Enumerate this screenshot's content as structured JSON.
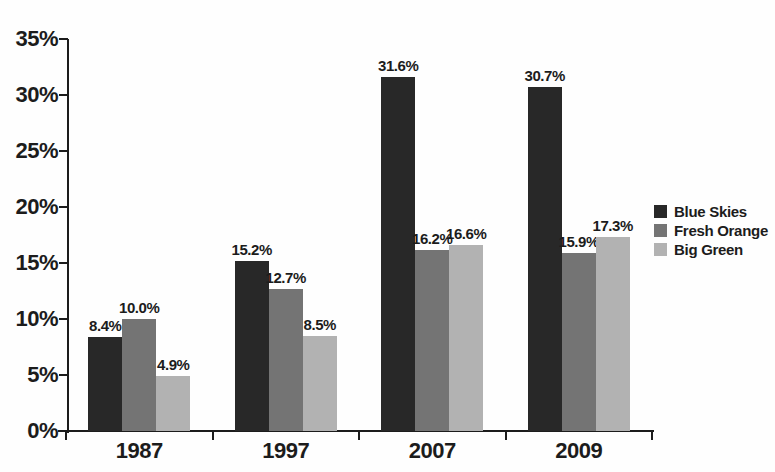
{
  "chart_data": {
    "type": "bar",
    "title": "",
    "categories": [
      "1987",
      "1997",
      "2007",
      "2009"
    ],
    "series": [
      {
        "name": "Blue Skies",
        "color": "#282828",
        "values": [
          8.4,
          15.2,
          31.6,
          30.7
        ],
        "labels": [
          "8.4%",
          "15.2%",
          "31.6%",
          "30.7%"
        ]
      },
      {
        "name": "Fresh Orange",
        "color": "#747474",
        "values": [
          10.0,
          12.7,
          16.2,
          15.9
        ],
        "labels": [
          "10.0%",
          "12.7%",
          "16.2%",
          "15.9%"
        ]
      },
      {
        "name": "Big Green",
        "color": "#b2b2b2",
        "values": [
          4.9,
          8.5,
          16.6,
          17.3
        ],
        "labels": [
          "4.9%",
          "8.5%",
          "16.6%",
          "17.3%"
        ]
      }
    ],
    "y_axis": {
      "min": 0,
      "max": 35,
      "tick_step": 5,
      "tick_labels": [
        "0%",
        "5%",
        "10%",
        "15%",
        "20%",
        "25%",
        "30%",
        "35%"
      ]
    },
    "x_axis": {
      "tick_labels": [
        "1987",
        "1997",
        "2007",
        "2009"
      ]
    },
    "legend_position": "right",
    "grid": false,
    "data_labels_shown": true,
    "axis_color": "#1c1c1c",
    "text_color": "#1c1c1c",
    "background_color": "#fefefe"
  }
}
